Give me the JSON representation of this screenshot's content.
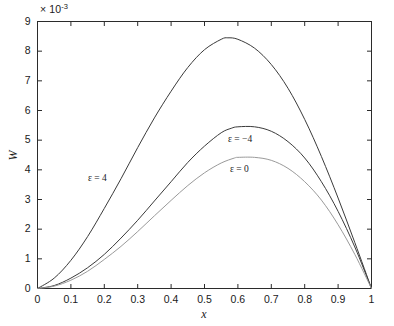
{
  "figure": {
    "axis_multiplier_prefix": "× 10",
    "axis_multiplier_exponent": "-3",
    "xlabel": "x",
    "ylabel": "W",
    "background_color": "#ffffff",
    "axis_color": "#2b2b2b"
  },
  "axes": {
    "x": {
      "min": 0,
      "max": 1,
      "tick_labels": [
        "0",
        "0.1",
        "0.2",
        "0.3",
        "0.4",
        "0.5",
        "0.6",
        "0.7",
        "0.8",
        "0.9",
        "1"
      ],
      "tick_values": [
        0,
        0.1,
        0.2,
        0.3,
        0.4,
        0.5,
        0.6,
        0.7,
        0.8,
        0.9,
        1
      ]
    },
    "y": {
      "min": 0,
      "max": 9,
      "scale_factor": 0.001,
      "tick_labels": [
        "0",
        "1",
        "2",
        "3",
        "4",
        "5",
        "6",
        "7",
        "8",
        "9"
      ],
      "tick_values": [
        0,
        1,
        2,
        3,
        4,
        5,
        6,
        7,
        8,
        9
      ]
    }
  },
  "curve_labels": [
    {
      "id": "eps-4",
      "text": "ε = 4"
    },
    {
      "id": "eps-neg4",
      "text": "ε = −4"
    },
    {
      "id": "eps-0",
      "text": "ε = 0"
    }
  ],
  "chart_data": {
    "type": "line",
    "title": "",
    "xlabel": "x",
    "ylabel": "W",
    "y_multiplier": "× 10⁻³",
    "xlim": [
      0,
      1
    ],
    "ylim": [
      0,
      9
    ],
    "grid": false,
    "legend_position": "inline-annotations",
    "series": [
      {
        "name": "ε = 4",
        "color": "#3a3a3a",
        "peak_x": 0.57,
        "peak_y": 8.45,
        "x": [
          0,
          0.05,
          0.1,
          0.15,
          0.2,
          0.25,
          0.3,
          0.35,
          0.4,
          0.45,
          0.5,
          0.55,
          0.57,
          0.6,
          0.65,
          0.7,
          0.75,
          0.8,
          0.85,
          0.9,
          0.95,
          1.0
        ],
        "y": [
          0,
          0.35,
          0.95,
          1.75,
          2.7,
          3.7,
          4.75,
          5.75,
          6.65,
          7.45,
          8.05,
          8.4,
          8.45,
          8.4,
          8.1,
          7.55,
          6.75,
          5.7,
          4.45,
          3.05,
          1.55,
          0
        ]
      },
      {
        "name": "ε = −4",
        "color": "#3a3a3a",
        "peak_x": 0.58,
        "peak_y": 5.5,
        "x": [
          0,
          0.05,
          0.1,
          0.15,
          0.2,
          0.25,
          0.3,
          0.35,
          0.4,
          0.45,
          0.5,
          0.55,
          0.58,
          0.6,
          0.65,
          0.7,
          0.75,
          0.8,
          0.85,
          0.9,
          0.95,
          1.0
        ],
        "y": [
          0,
          0.1,
          0.35,
          0.7,
          1.15,
          1.7,
          2.3,
          2.95,
          3.6,
          4.25,
          4.8,
          5.25,
          5.4,
          5.45,
          5.45,
          5.3,
          4.95,
          4.4,
          3.6,
          2.6,
          1.4,
          0
        ]
      },
      {
        "name": "ε = 0",
        "color": "#9a9a9a",
        "peak_x": 0.59,
        "peak_y": 4.45,
        "x": [
          0,
          0.05,
          0.1,
          0.15,
          0.2,
          0.25,
          0.3,
          0.35,
          0.4,
          0.45,
          0.5,
          0.55,
          0.59,
          0.6,
          0.65,
          0.7,
          0.75,
          0.8,
          0.85,
          0.9,
          0.95,
          1.0
        ],
        "y": [
          0,
          0.08,
          0.28,
          0.58,
          0.98,
          1.42,
          1.92,
          2.45,
          2.97,
          3.47,
          3.9,
          4.23,
          4.4,
          4.42,
          4.42,
          4.32,
          4.05,
          3.6,
          2.98,
          2.15,
          1.15,
          0
        ]
      }
    ]
  }
}
